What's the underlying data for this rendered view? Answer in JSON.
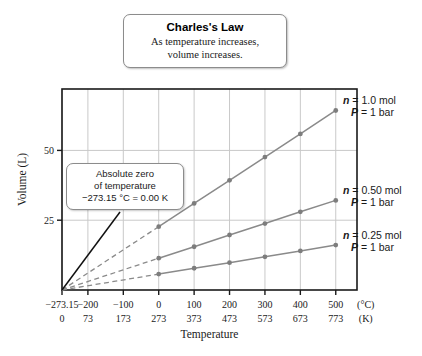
{
  "title": {
    "main": "Charles's Law",
    "sub_line1": "As temperature increases,",
    "sub_line2": "volume increases."
  },
  "annotation": {
    "line1": "Absolute zero",
    "line2": "of temperature",
    "line3": "−273.15 °C = 0.00 K"
  },
  "axes": {
    "ylabel": "Volume (L)",
    "xlabel": "Temperature",
    "celsius_unit": "(°C)",
    "kelvin_unit": "(K)"
  },
  "series_labels": [
    {
      "n": "n = 1.0 mol",
      "p": "P = 1 bar"
    },
    {
      "n": "n = 0.50 mol",
      "p": "P = 1 bar"
    },
    {
      "n": "n = 0.25 mol",
      "p": "P = 1 bar"
    }
  ],
  "colors": {
    "line": "#8a8a8a",
    "marker": "#7d7d7d",
    "grid": "#c9c9c9",
    "frame": "#1a1a1a",
    "leader": "#111111",
    "background": "#ffffff"
  },
  "chart_data": {
    "type": "line",
    "title": "Charles's Law",
    "subtitle": "As temperature increases, volume increases.",
    "xlabel": "Temperature",
    "ylabel": "Volume (L)",
    "grid": true,
    "legend": "inline-right",
    "xlim_c": [
      -273.15,
      560
    ],
    "ylim": [
      0,
      72
    ],
    "yticks": [
      25,
      50
    ],
    "xticks_celsius": [
      -273.15,
      -200,
      -100,
      0,
      100,
      200,
      300,
      400,
      500
    ],
    "xticks_kelvin": [
      0,
      73,
      173,
      273,
      373,
      473,
      573,
      673,
      773
    ],
    "x_celsius": [
      0,
      100,
      200,
      300,
      400,
      500
    ],
    "x_kelvin": [
      273,
      373,
      473,
      573,
      673,
      773
    ],
    "absolute_zero_c": -273.15,
    "absolute_zero_k": 0.0,
    "series": [
      {
        "name": "n = 1.0 mol, P = 1 bar",
        "n_mol": 1.0,
        "pressure_bar": 1,
        "values": [
          22.7,
          31.0,
          39.3,
          47.6,
          55.9,
          64.3
        ],
        "extrapolated_from": [
          -273.15,
          0.0
        ]
      },
      {
        "name": "n = 0.50 mol, P = 1 bar",
        "n_mol": 0.5,
        "pressure_bar": 1,
        "values": [
          11.4,
          15.5,
          19.7,
          23.8,
          28.0,
          32.1
        ],
        "extrapolated_from": [
          -273.15,
          0.0
        ]
      },
      {
        "name": "n = 0.25 mol, P = 1 bar",
        "n_mol": 0.25,
        "pressure_bar": 1,
        "values": [
          5.7,
          7.8,
          9.8,
          11.9,
          14.0,
          16.1
        ],
        "extrapolated_from": [
          -273.15,
          0.0
        ]
      }
    ]
  }
}
